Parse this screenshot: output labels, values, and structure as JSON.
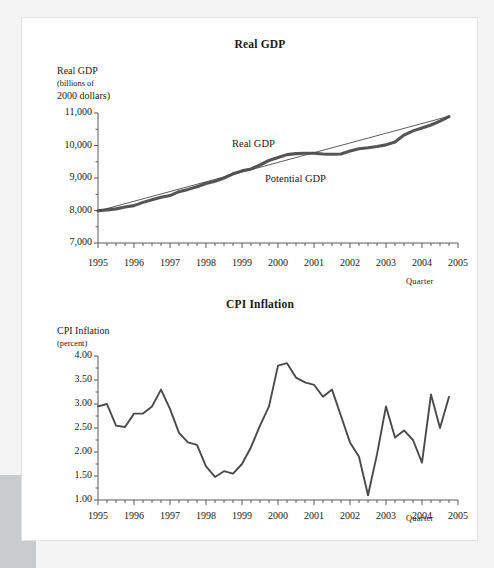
{
  "page": {
    "background": "#f4f4f4",
    "sheet_color": "#ffffff",
    "corner_block_color": "#c9cbcd"
  },
  "style": {
    "ink": "#3f3f3f",
    "thick_line_color": "#555555",
    "thin_line_color": "#4a4a4a",
    "axis_color": "#5a5a5a",
    "text_color": "#1a1a1a"
  },
  "chart_data": [
    {
      "type": "line",
      "id": "real-gdp",
      "title": "Real GDP",
      "ylabel_lines": [
        "Real GDP",
        "(billions of",
        "2000 dollars)"
      ],
      "ylabel": "Real GDP (billions of 2000 dollars)",
      "xlabel": "Quarter",
      "ylim": [
        7000,
        11000
      ],
      "ytick_labels": [
        "11,000",
        "10,000",
        "9,000",
        "8,000",
        "7,000"
      ],
      "ytick_values": [
        11000,
        10000,
        9000,
        8000,
        7000
      ],
      "xlim": [
        1995,
        2005
      ],
      "xtick_labels": [
        "1995",
        "1996",
        "1997",
        "1998",
        "1999",
        "2000",
        "2001",
        "2002",
        "2003",
        "2004",
        "2005"
      ],
      "xtick_values": [
        1995,
        1996,
        1997,
        1998,
        1999,
        2000,
        2001,
        2002,
        2003,
        2004,
        2005
      ],
      "minor_ticks_per_year": 4,
      "grid": false,
      "legend_position": "inline-annotation",
      "series": [
        {
          "name": "Real GDP",
          "style": "thick",
          "x": [
            1995.0,
            1995.25,
            1995.5,
            1995.75,
            1996.0,
            1996.25,
            1996.5,
            1996.75,
            1997.0,
            1997.25,
            1997.5,
            1997.75,
            1998.0,
            1998.25,
            1998.5,
            1998.75,
            1999.0,
            1999.25,
            1999.5,
            1999.75,
            2000.0,
            2000.25,
            2000.5,
            2000.75,
            2001.0,
            2001.25,
            2001.5,
            2001.75,
            2002.0,
            2002.25,
            2002.5,
            2002.75,
            2003.0,
            2003.25,
            2003.5,
            2003.75,
            2004.0,
            2004.25,
            2004.5,
            2004.75
          ],
          "values": [
            7990,
            8020,
            8050,
            8110,
            8150,
            8250,
            8330,
            8410,
            8460,
            8580,
            8650,
            8730,
            8830,
            8900,
            9000,
            9130,
            9220,
            9280,
            9400,
            9540,
            9630,
            9720,
            9750,
            9760,
            9760,
            9740,
            9730,
            9740,
            9830,
            9900,
            9930,
            9970,
            10020,
            10110,
            10320,
            10450,
            10540,
            10630,
            10750,
            10890
          ]
        },
        {
          "name": "Potential GDP",
          "style": "thin",
          "x": [
            1995.0,
            2004.75
          ],
          "values": [
            7985,
            10900
          ]
        }
      ],
      "annotations": [
        {
          "text": "Real GDP",
          "near_x": 1999.0,
          "near_y": 10050
        },
        {
          "text": "Potential GDP",
          "near_x": 2000.0,
          "near_y": 9350
        }
      ]
    },
    {
      "type": "line",
      "id": "cpi-inflation",
      "title": "CPI Inflation",
      "ylabel_lines": [
        "CPI Inflation",
        "(percent)"
      ],
      "ylabel": "CPI Inflation (percent)",
      "xlabel": "Quarter",
      "ylim": [
        1.0,
        4.0
      ],
      "ytick_labels": [
        "4.00",
        "3.50",
        "3.00",
        "2.50",
        "2.00",
        "1.50",
        "1.00"
      ],
      "ytick_values": [
        4.0,
        3.5,
        3.0,
        2.5,
        2.0,
        1.5,
        1.0
      ],
      "xlim": [
        1995,
        2005
      ],
      "xtick_labels": [
        "1995",
        "1996",
        "1997",
        "1998",
        "1999",
        "2000",
        "2001",
        "2002",
        "2003",
        "2004",
        "2005"
      ],
      "xtick_values": [
        1995,
        1996,
        1997,
        1998,
        1999,
        2000,
        2001,
        2002,
        2003,
        2004,
        2005
      ],
      "minor_ticks_per_year": 4,
      "grid": false,
      "legend_position": "none",
      "series": [
        {
          "name": "CPI Inflation",
          "style": "medium",
          "x": [
            1995.0,
            1995.25,
            1995.5,
            1995.75,
            1996.0,
            1996.25,
            1996.5,
            1996.75,
            1997.0,
            1997.25,
            1997.5,
            1997.75,
            1998.0,
            1998.25,
            1998.5,
            1998.75,
            1999.0,
            1999.25,
            1999.5,
            1999.75,
            2000.0,
            2000.25,
            2000.5,
            2000.75,
            2001.0,
            2001.25,
            2001.5,
            2001.75,
            2002.0,
            2002.25,
            2002.5,
            2002.75,
            2003.0,
            2003.25,
            2003.5,
            2003.75,
            2004.0,
            2004.25,
            2004.5,
            2004.75
          ],
          "values": [
            2.95,
            3.0,
            2.55,
            2.52,
            2.8,
            2.8,
            2.95,
            3.3,
            2.9,
            2.4,
            2.2,
            2.15,
            1.7,
            1.48,
            1.6,
            1.55,
            1.75,
            2.1,
            2.55,
            2.95,
            3.8,
            3.85,
            3.55,
            3.45,
            3.4,
            3.15,
            3.3,
            2.75,
            2.2,
            1.9,
            1.1,
            1.95,
            2.95,
            2.3,
            2.45,
            2.25,
            1.78,
            3.2,
            2.5,
            3.15
          ]
        }
      ]
    }
  ]
}
